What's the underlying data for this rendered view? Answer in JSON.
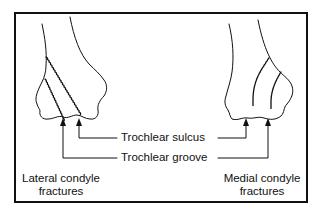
{
  "figure": {
    "labels": {
      "trochlear_sulcus": "Trochlear sulcus",
      "trochlear_groove": "Trochlear groove"
    },
    "captions": {
      "left_line1": "Lateral condyle",
      "left_line2": "fractures",
      "right_line1": "Medial condyle",
      "right_line2": "fractures"
    },
    "colors": {
      "stroke": "#111111",
      "background": "#ffffff"
    }
  }
}
